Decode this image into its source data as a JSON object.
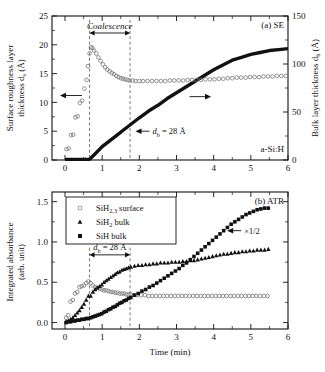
{
  "figure": {
    "xlabel": "Time (min)",
    "xlim": [
      -0.35,
      6.0
    ],
    "xticks": [
      "0",
      "1",
      "2",
      "3",
      "4",
      "5",
      "6"
    ],
    "xtickvals": [
      0,
      1,
      2,
      3,
      4,
      5,
      6
    ]
  },
  "panel_a": {
    "label": "(a) SE",
    "material": "a-Si:H",
    "ylabel_line1": "Surface roughness layer",
    "ylabel_line2": "thickness d",
    "ylabel_sub": "s",
    "ylabel_unit": " (Å)",
    "ylabel_right_main": "Bulk layer thickness d",
    "ylabel_right_sub": "b",
    "ylabel_right_unit": " (Å)",
    "yticks_left": [
      "0",
      "5",
      "10",
      "15",
      "20",
      "25"
    ],
    "ytickvals_left": [
      0,
      5,
      10,
      15,
      20,
      25
    ],
    "yticks_right": [
      "0",
      "50",
      "100",
      "150"
    ],
    "ytickvals_right": [
      0,
      50,
      100,
      150
    ],
    "annotation_coalescence": "Coalescence",
    "annotation_db": "d",
    "annotation_db_sub": "b",
    "annotation_db_rest": " = 28 Å",
    "coalescence_start": 0.66,
    "coalescence_end": 1.75
  },
  "panel_b": {
    "label": "(b) ATR",
    "ylabel_line1": "Integrated absorbance",
    "ylabel_line2": "(arb. unit)",
    "yticks": [
      "0.0",
      "0.5",
      "1.0",
      "1.5"
    ],
    "ytickvals": [
      0.0,
      0.5,
      1.0,
      1.5
    ],
    "ylim": [
      -0.08,
      1.62
    ],
    "annotation_db": "d",
    "annotation_db_sub": "b",
    "annotation_db_rest": " = 28 Å",
    "annotation_half": "×1/2",
    "legend": [
      {
        "marker": "open-circle",
        "text_pre": "SiH",
        "text_sub": "2,3",
        "text_post": " surface"
      },
      {
        "marker": "filled-triangle",
        "text_pre": "SiH",
        "text_sub": "2",
        "text_post": " bulk"
      },
      {
        "marker": "filled-square",
        "text_pre": "SiH",
        "text_sub": "",
        "text_post": " bulk"
      }
    ]
  },
  "chart_data": [
    {
      "type": "scatter",
      "title": "(a) SE",
      "xlabel": "Time (min)",
      "ylabel": "Surface roughness layer thickness d_s (Å)",
      "ylabel_right": "Bulk layer thickness d_b (Å)",
      "xlim": [
        -0.35,
        6.0
      ],
      "ylim_left": [
        0,
        25
      ],
      "ylim_right": [
        0,
        150
      ],
      "grid": false,
      "series": [
        {
          "name": "Surface roughness layer thickness d_s",
          "axis": "left",
          "marker": "open-circle",
          "x": [
            0.04,
            0.1,
            0.16,
            0.22,
            0.28,
            0.34,
            0.4,
            0.46,
            0.52,
            0.58,
            0.62,
            0.66,
            0.7,
            0.74,
            0.78,
            0.84,
            0.9,
            0.96,
            1.02,
            1.08,
            1.14,
            1.2,
            1.26,
            1.32,
            1.38,
            1.44,
            1.5,
            1.56,
            1.62,
            1.68,
            1.74,
            1.82,
            1.9,
            2.0,
            2.1,
            2.22,
            2.34,
            2.46,
            2.58,
            2.7,
            2.82,
            2.94,
            3.06,
            3.18,
            3.3,
            3.42,
            3.54,
            3.66,
            3.78,
            3.9,
            4.02,
            4.14,
            4.26,
            4.38,
            4.5,
            4.62,
            4.74,
            4.86,
            4.98,
            5.1,
            5.22,
            5.34,
            5.46,
            5.58,
            5.7,
            5.82,
            5.94
          ],
          "y": [
            1.9,
            2.0,
            4.3,
            4.4,
            7.4,
            7.6,
            9.9,
            10.3,
            12.4,
            13.9,
            16.3,
            18.5,
            19.6,
            19.4,
            19.0,
            18.5,
            17.8,
            17.2,
            16.6,
            16.1,
            15.7,
            15.4,
            15.1,
            14.9,
            14.6,
            14.4,
            14.2,
            14.1,
            14.0,
            13.9,
            13.8,
            13.8,
            13.7,
            13.7,
            13.7,
            13.7,
            13.7,
            13.7,
            13.7,
            13.7,
            13.8,
            13.8,
            13.8,
            13.8,
            13.9,
            13.9,
            13.9,
            13.9,
            14.0,
            14.0,
            14.0,
            14.1,
            14.1,
            14.2,
            14.2,
            14.3,
            14.3,
            14.3,
            14.4,
            14.4,
            14.4,
            14.5,
            14.5,
            14.5,
            14.6,
            14.6,
            14.6
          ]
        },
        {
          "name": "Bulk layer thickness d_b",
          "axis": "right",
          "marker": "filled-square-thickline",
          "x": [
            0.0,
            0.1,
            0.2,
            0.3,
            0.4,
            0.5,
            0.6,
            0.66,
            0.8,
            1.0,
            1.2,
            1.4,
            1.6,
            1.75,
            2.0,
            2.25,
            2.5,
            2.75,
            3.0,
            3.25,
            3.5,
            3.75,
            4.0,
            4.25,
            4.5,
            4.75,
            5.0,
            5.25,
            5.5,
            5.75,
            6.0
          ],
          "y": [
            0.6,
            0.6,
            0.6,
            0.6,
            0.6,
            0.6,
            0.6,
            0.6,
            6.0,
            14.0,
            20.0,
            26.0,
            32.0,
            28.0,
            44.0,
            51.0,
            57.0,
            64.0,
            70.0,
            76.0,
            82.0,
            88.0,
            94.0,
            99.0,
            104.0,
            107.0,
            110.0,
            112.0,
            114.0,
            115.0,
            116.0
          ]
        }
      ],
      "annotations": [
        {
          "text": "Coalescence",
          "x_start": 0.66,
          "x_end": 1.75,
          "style": "italic double-arrow"
        },
        {
          "text": "d_b = 28 Å",
          "x": 2.6,
          "y_right": 28
        },
        {
          "text": "a-Si:H",
          "x": 4.6
        },
        {
          "text": "(a) SE",
          "x": 5.3
        }
      ]
    },
    {
      "type": "scatter",
      "title": "(b) ATR",
      "xlabel": "Time (min)",
      "ylabel": "Integrated absorbance (arb. unit)",
      "xlim": [
        -0.35,
        6.0
      ],
      "ylim": [
        -0.08,
        1.62
      ],
      "grid": false,
      "legend_position": "upper-left",
      "series": [
        {
          "name": "SiH2,3 surface",
          "marker": "open-circle",
          "x": [
            0.03,
            0.09,
            0.15,
            0.21,
            0.27,
            0.33,
            0.39,
            0.45,
            0.51,
            0.57,
            0.63,
            0.69,
            0.75,
            0.81,
            0.87,
            0.93,
            0.99,
            1.05,
            1.11,
            1.17,
            1.23,
            1.29,
            1.35,
            1.41,
            1.47,
            1.53,
            1.59,
            1.65,
            1.71,
            1.77,
            1.85,
            1.95,
            2.05,
            2.15,
            2.25,
            2.35,
            2.45,
            2.55,
            2.65,
            2.75,
            2.85,
            2.95,
            3.05,
            3.15,
            3.25,
            3.35,
            3.45,
            3.55,
            3.65,
            3.75,
            3.85,
            3.95,
            4.05,
            4.15,
            4.25,
            4.35,
            4.45,
            4.55,
            4.65,
            4.75,
            4.85,
            4.95,
            5.05,
            5.15,
            5.25,
            5.35,
            5.45
          ],
          "y": [
            0.06,
            0.09,
            0.26,
            0.28,
            0.36,
            0.38,
            0.44,
            0.45,
            0.46,
            0.49,
            0.51,
            0.49,
            0.46,
            0.44,
            0.43,
            0.42,
            0.41,
            0.4,
            0.4,
            0.39,
            0.38,
            0.38,
            0.37,
            0.37,
            0.36,
            0.36,
            0.36,
            0.35,
            0.35,
            0.35,
            0.34,
            0.34,
            0.34,
            0.34,
            0.33,
            0.33,
            0.33,
            0.33,
            0.33,
            0.33,
            0.33,
            0.33,
            0.33,
            0.33,
            0.33,
            0.33,
            0.33,
            0.33,
            0.33,
            0.33,
            0.33,
            0.33,
            0.33,
            0.33,
            0.33,
            0.33,
            0.33,
            0.33,
            0.33,
            0.33,
            0.33,
            0.33,
            0.33,
            0.33,
            0.33,
            0.33,
            0.33
          ]
        },
        {
          "name": "SiH2 bulk",
          "marker": "filled-triangle",
          "x": [
            0.03,
            0.09,
            0.15,
            0.21,
            0.27,
            0.33,
            0.39,
            0.45,
            0.51,
            0.57,
            0.63,
            0.69,
            0.75,
            0.81,
            0.87,
            0.93,
            0.99,
            1.05,
            1.11,
            1.17,
            1.23,
            1.29,
            1.35,
            1.41,
            1.47,
            1.53,
            1.59,
            1.65,
            1.71,
            1.77,
            1.87,
            1.97,
            2.07,
            2.17,
            2.27,
            2.37,
            2.47,
            2.57,
            2.67,
            2.77,
            2.87,
            2.97,
            3.07,
            3.17,
            3.27,
            3.37,
            3.47,
            3.57,
            3.67,
            3.77,
            3.87,
            3.97,
            4.07,
            4.17,
            4.27,
            4.37,
            4.47,
            4.57,
            4.67,
            4.77,
            4.87,
            4.97,
            5.07,
            5.17,
            5.27,
            5.37,
            5.47
          ],
          "y": [
            0.01,
            0.02,
            0.04,
            0.06,
            0.09,
            0.12,
            0.15,
            0.19,
            0.23,
            0.28,
            0.33,
            0.33,
            0.38,
            0.41,
            0.43,
            0.45,
            0.47,
            0.5,
            0.52,
            0.54,
            0.56,
            0.58,
            0.6,
            0.62,
            0.63,
            0.65,
            0.66,
            0.67,
            0.68,
            0.69,
            0.7,
            0.71,
            0.71,
            0.72,
            0.72,
            0.73,
            0.73,
            0.74,
            0.74,
            0.74,
            0.75,
            0.75,
            0.75,
            0.76,
            0.76,
            0.77,
            0.77,
            0.78,
            0.79,
            0.8,
            0.81,
            0.82,
            0.83,
            0.84,
            0.85,
            0.85,
            0.86,
            0.87,
            0.87,
            0.88,
            0.88,
            0.89,
            0.89,
            0.9,
            0.9,
            0.9,
            0.91
          ]
        },
        {
          "name": "SiH bulk",
          "marker": "filled-square",
          "scale_note": "×1/2",
          "x": [
            0.03,
            0.09,
            0.15,
            0.21,
            0.27,
            0.33,
            0.39,
            0.45,
            0.51,
            0.57,
            0.63,
            0.69,
            0.75,
            0.81,
            0.87,
            0.93,
            0.99,
            1.05,
            1.11,
            1.17,
            1.23,
            1.29,
            1.35,
            1.41,
            1.47,
            1.53,
            1.59,
            1.65,
            1.71,
            1.77,
            1.87,
            1.97,
            2.07,
            2.17,
            2.27,
            2.37,
            2.47,
            2.57,
            2.67,
            2.77,
            2.87,
            2.97,
            3.07,
            3.17,
            3.27,
            3.37,
            3.47,
            3.57,
            3.67,
            3.77,
            3.87,
            3.97,
            4.07,
            4.17,
            4.27,
            4.37,
            4.47,
            4.57,
            4.67,
            4.77,
            4.87,
            4.97,
            5.07,
            5.17,
            5.27,
            5.37,
            5.47
          ],
          "y": [
            0.0,
            0.01,
            0.01,
            0.02,
            0.02,
            0.03,
            0.03,
            0.04,
            0.04,
            0.05,
            0.05,
            0.06,
            0.07,
            0.08,
            0.09,
            0.1,
            0.11,
            0.13,
            0.14,
            0.16,
            0.17,
            0.19,
            0.2,
            0.22,
            0.24,
            0.25,
            0.27,
            0.28,
            0.3,
            0.31,
            0.34,
            0.36,
            0.39,
            0.41,
            0.44,
            0.46,
            0.49,
            0.52,
            0.55,
            0.58,
            0.61,
            0.64,
            0.67,
            0.71,
            0.74,
            0.78,
            0.82,
            0.86,
            0.9,
            0.94,
            0.98,
            1.02,
            1.06,
            1.1,
            1.14,
            1.18,
            1.22,
            1.25,
            1.28,
            1.31,
            1.34,
            1.36,
            1.38,
            1.4,
            1.41,
            1.42,
            1.42
          ]
        }
      ],
      "annotations": [
        {
          "text": "d_b = 28 Å",
          "x_start": 0.66,
          "x_end": 1.75,
          "style": "double-arrow"
        },
        {
          "text": "×1/2",
          "x": 4.9,
          "y": 1.15
        },
        {
          "text": "(b) ATR",
          "x": 5.2
        }
      ]
    }
  ]
}
